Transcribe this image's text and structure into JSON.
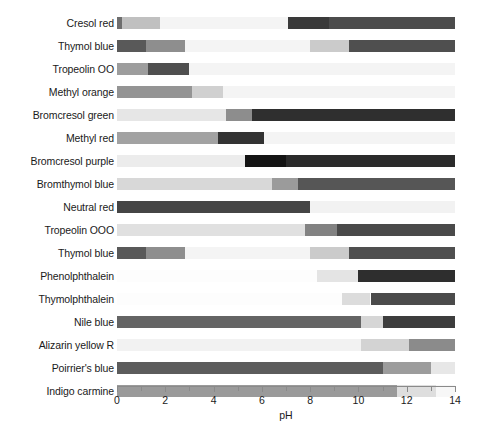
{
  "chart_data": {
    "type": "bar",
    "title": "",
    "subtitle": "",
    "xlabel": "pH",
    "ylabel": "",
    "xlim": [
      0,
      14
    ],
    "xticks": [
      0,
      1,
      2,
      3,
      4,
      5,
      6,
      7,
      8,
      9,
      10,
      11,
      12,
      13,
      14
    ],
    "xtick_labels": [
      "0",
      "",
      "2",
      "",
      "4",
      "",
      "6",
      "",
      "8",
      "",
      "10",
      "",
      "12",
      "",
      "14"
    ],
    "grid": false,
    "legend": "none",
    "orientation": "horizontal",
    "categories": [
      "Cresol red",
      "Thymol blue",
      "Tropeolin OO",
      "Methyl orange",
      "Bromcresol green",
      "Methyl red",
      "Bromcresol purple",
      "Bromthymol blue",
      "Neutral red",
      "Tropeolin OOO",
      "Thymol blue",
      "Phenolphthalein",
      "Thymolphthalein",
      "Nile blue",
      "Alizarin yellow R",
      "Poirrier's blue",
      "Indigo carmine"
    ],
    "rows": [
      {
        "name": "Cresol red",
        "segments": [
          {
            "start": 0.0,
            "end": 0.2,
            "color": "#6e6e6e"
          },
          {
            "start": 0.2,
            "end": 1.8,
            "color": "#c0c0c0"
          },
          {
            "start": 1.8,
            "end": 7.1,
            "color": "#f4f4f4"
          },
          {
            "start": 7.1,
            "end": 8.8,
            "color": "#3a3a3a"
          },
          {
            "start": 8.8,
            "end": 14.0,
            "color": "#4c4c4c"
          }
        ]
      },
      {
        "name": "Thymol blue",
        "segments": [
          {
            "start": 0.0,
            "end": 1.2,
            "color": "#595959"
          },
          {
            "start": 1.2,
            "end": 2.8,
            "color": "#8e8e8e"
          },
          {
            "start": 2.8,
            "end": 8.0,
            "color": "#f4f4f4"
          },
          {
            "start": 8.0,
            "end": 9.6,
            "color": "#cbcbcb"
          },
          {
            "start": 9.6,
            "end": 14.0,
            "color": "#4f4f4f"
          }
        ]
      },
      {
        "name": "Tropeolin OO",
        "segments": [
          {
            "start": 0.0,
            "end": 1.3,
            "color": "#9d9d9d"
          },
          {
            "start": 1.3,
            "end": 3.0,
            "color": "#4f4f4f"
          },
          {
            "start": 3.0,
            "end": 14.0,
            "color": "#f4f4f4"
          }
        ]
      },
      {
        "name": "Methyl orange",
        "segments": [
          {
            "start": 0.0,
            "end": 3.1,
            "color": "#949494"
          },
          {
            "start": 3.1,
            "end": 4.4,
            "color": "#d0d0d0"
          },
          {
            "start": 4.4,
            "end": 14.0,
            "color": "#f4f4f4"
          }
        ]
      },
      {
        "name": "Bromcresol green",
        "segments": [
          {
            "start": 0.0,
            "end": 4.5,
            "color": "#e6e6e6"
          },
          {
            "start": 4.5,
            "end": 5.6,
            "color": "#8d8d8d"
          },
          {
            "start": 5.6,
            "end": 14.0,
            "color": "#2f2f2f"
          }
        ]
      },
      {
        "name": "Methyl red",
        "segments": [
          {
            "start": 0.0,
            "end": 4.2,
            "color": "#a2a2a2"
          },
          {
            "start": 4.2,
            "end": 6.1,
            "color": "#333333"
          },
          {
            "start": 6.1,
            "end": 14.0,
            "color": "#f4f4f4"
          }
        ]
      },
      {
        "name": "Bromcresol purple",
        "segments": [
          {
            "start": 0.0,
            "end": 5.3,
            "color": "#ececec"
          },
          {
            "start": 5.3,
            "end": 7.0,
            "color": "#141414"
          },
          {
            "start": 7.0,
            "end": 14.0,
            "color": "#2b2b2b"
          }
        ]
      },
      {
        "name": "Bromthymol blue",
        "segments": [
          {
            "start": 0.0,
            "end": 6.4,
            "color": "#d8d8d8"
          },
          {
            "start": 6.4,
            "end": 7.5,
            "color": "#9b9b9b"
          },
          {
            "start": 7.5,
            "end": 14.0,
            "color": "#565656"
          }
        ]
      },
      {
        "name": "Neutral red",
        "segments": [
          {
            "start": 0.0,
            "end": 8.0,
            "color": "#454545"
          },
          {
            "start": 8.0,
            "end": 14.0,
            "color": "#f2f2f2"
          }
        ]
      },
      {
        "name": "Tropeolin OOO",
        "segments": [
          {
            "start": 0.0,
            "end": 7.8,
            "color": "#e0e0e0"
          },
          {
            "start": 7.8,
            "end": 9.1,
            "color": "#828282"
          },
          {
            "start": 9.1,
            "end": 14.0,
            "color": "#4a4a4a"
          }
        ]
      },
      {
        "name": "Thymol blue",
        "segments": [
          {
            "start": 0.0,
            "end": 1.2,
            "color": "#595959"
          },
          {
            "start": 1.2,
            "end": 2.8,
            "color": "#8e8e8e"
          },
          {
            "start": 2.8,
            "end": 8.0,
            "color": "#f4f4f4"
          },
          {
            "start": 8.0,
            "end": 9.6,
            "color": "#cbcbcb"
          },
          {
            "start": 9.6,
            "end": 14.0,
            "color": "#4f4f4f"
          }
        ]
      },
      {
        "name": "Phenolphthalein",
        "segments": [
          {
            "start": 0.0,
            "end": 8.3,
            "color": "#fdfdfd"
          },
          {
            "start": 8.3,
            "end": 10.0,
            "color": "#e4e4e4"
          },
          {
            "start": 10.0,
            "end": 14.0,
            "color": "#2e2e2e"
          }
        ]
      },
      {
        "name": "Thymolphthalein",
        "segments": [
          {
            "start": 0.0,
            "end": 9.3,
            "color": "#fdfdfd"
          },
          {
            "start": 9.3,
            "end": 10.5,
            "color": "#dcdcdc"
          },
          {
            "start": 10.5,
            "end": 14.0,
            "color": "#4b4b4b"
          }
        ]
      },
      {
        "name": "Nile blue",
        "segments": [
          {
            "start": 0.0,
            "end": 10.1,
            "color": "#646464"
          },
          {
            "start": 10.1,
            "end": 11.0,
            "color": "#d6d6d6"
          },
          {
            "start": 11.0,
            "end": 14.0,
            "color": "#3d3d3d"
          }
        ]
      },
      {
        "name": "Alizarin yellow R",
        "segments": [
          {
            "start": 0.0,
            "end": 10.1,
            "color": "#f2f2f2"
          },
          {
            "start": 10.1,
            "end": 12.1,
            "color": "#d3d3d3"
          },
          {
            "start": 12.1,
            "end": 14.0,
            "color": "#8b8b8b"
          }
        ]
      },
      {
        "name": "Poirrier's blue",
        "segments": [
          {
            "start": 0.0,
            "end": 11.0,
            "color": "#5c5c5c"
          },
          {
            "start": 11.0,
            "end": 13.0,
            "color": "#9c9c9c"
          },
          {
            "start": 13.0,
            "end": 14.0,
            "color": "#e7e7e7"
          }
        ]
      },
      {
        "name": "Indigo carmine",
        "segments": [
          {
            "start": 0.0,
            "end": 11.6,
            "color": "#9a9a9a"
          },
          {
            "start": 11.6,
            "end": 13.2,
            "color": "#dedede"
          },
          {
            "start": 13.2,
            "end": 14.0,
            "color": "#f7f7f7"
          }
        ]
      }
    ]
  },
  "axis": {
    "title": "pH",
    "min": 0,
    "max": 14,
    "tick_color": "#8a8a8a"
  }
}
